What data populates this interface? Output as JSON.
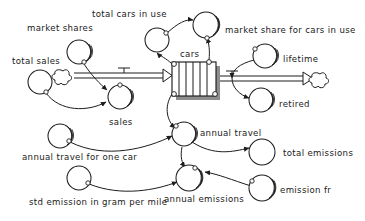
{
  "diagram": {
    "type": "stock-and-flow",
    "title": "",
    "background_color": "#ffffff",
    "line_color": "#1d1d1d",
    "text_color": "#1a1a1a",
    "stocks": [
      {
        "id": "cars",
        "label": "cars",
        "shape": "conveyor-box",
        "x": 172,
        "y": 62,
        "width": 44,
        "height": 34,
        "label_x": 180,
        "label_y": 57
      }
    ],
    "flows": [
      {
        "id": "inflow",
        "label": "",
        "from": "cloud-source-left",
        "to": "cars",
        "valve_x": 124,
        "valve_y": 75
      },
      {
        "id": "outflow",
        "label": "",
        "from": "cars",
        "to": "cloud-sink-right",
        "valve_x": 262,
        "valve_y": 80
      }
    ],
    "clouds": [
      {
        "id": "cloud-source-left",
        "x": 65,
        "y": 76
      },
      {
        "id": "cloud-sink-right",
        "x": 320,
        "y": 80
      }
    ],
    "variables": [
      {
        "id": "market-shares",
        "label": "market shares",
        "x": 79,
        "y": 52,
        "r": 12,
        "shadow": true,
        "label_x": 27,
        "label_y": 31
      },
      {
        "id": "total-sales",
        "label": "total sales",
        "x": 40,
        "y": 82,
        "r": 12,
        "shadow": false,
        "label_x": 12,
        "label_y": 64
      },
      {
        "id": "sales",
        "label": "sales",
        "x": 120,
        "y": 97,
        "r": 12,
        "shadow": true,
        "label_x": 109,
        "label_y": 125
      },
      {
        "id": "total-cars-in-use",
        "label": "total cars in use",
        "x": 157,
        "y": 40,
        "r": 12,
        "shadow": false,
        "label_x": 92,
        "label_y": 17
      },
      {
        "id": "market-share-for-cars-in-use",
        "label": "market share for cars in use",
        "x": 206,
        "y": 25,
        "r": 13,
        "shadow": true,
        "label_x": 225,
        "label_y": 33
      },
      {
        "id": "lifetime",
        "label": "lifetime",
        "x": 265,
        "y": 56,
        "r": 12,
        "shadow": true,
        "label_x": 283,
        "label_y": 62
      },
      {
        "id": "retired",
        "label": "retired",
        "x": 261,
        "y": 100,
        "r": 12,
        "shadow": true,
        "label_x": 279,
        "label_y": 107
      },
      {
        "id": "annual-travel",
        "label": "annual travel",
        "x": 184,
        "y": 134,
        "r": 12,
        "shadow": true,
        "label_x": 200,
        "label_y": 136
      },
      {
        "id": "annual-travel-for-one-car",
        "label": "annual travel for one car",
        "x": 60,
        "y": 136,
        "r": 12,
        "shadow": true,
        "label_x": 22,
        "label_y": 160
      },
      {
        "id": "total-emissions",
        "label": "total emissions",
        "x": 262,
        "y": 152,
        "r": 13,
        "shadow": false,
        "label_x": 283,
        "label_y": 156
      },
      {
        "id": "annual-emissions",
        "label": "annual emissions",
        "x": 189,
        "y": 178,
        "r": 13,
        "shadow": true,
        "label_x": 164,
        "label_y": 202
      },
      {
        "id": "emission-fr",
        "label": "emission fr",
        "x": 262,
        "y": 188,
        "r": 13,
        "shadow": true,
        "label_x": 280,
        "label_y": 193
      },
      {
        "id": "std-emission-in-gram-per-mile",
        "label": "std emission in gram per mile",
        "x": 79,
        "y": 178,
        "r": 12,
        "shadow": false,
        "label_x": 29,
        "label_y": 205
      }
    ],
    "links": [
      {
        "from": "market-shares",
        "to": "sales"
      },
      {
        "from": "total-sales",
        "to": "sales"
      },
      {
        "from": "total-cars-in-use",
        "to": "market-share-for-cars-in-use"
      },
      {
        "from": "cars",
        "to": "total-cars-in-use"
      },
      {
        "from": "cars",
        "to": "market-share-for-cars-in-use"
      },
      {
        "from": "lifetime",
        "to": "outflow-valve"
      },
      {
        "from": "outflow-valve",
        "to": "retired"
      },
      {
        "from": "cars",
        "to": "annual-travel"
      },
      {
        "from": "annual-travel-for-one-car",
        "to": "annual-travel"
      },
      {
        "from": "annual-travel",
        "to": "total-emissions"
      },
      {
        "from": "annual-travel",
        "to": "annual-emissions"
      },
      {
        "from": "std-emission-in-gram-per-mile",
        "to": "annual-emissions"
      },
      {
        "from": "emission-fr",
        "to": "annual-emissions"
      },
      {
        "from": "annual-emissions",
        "to": "total-emissions"
      }
    ]
  }
}
